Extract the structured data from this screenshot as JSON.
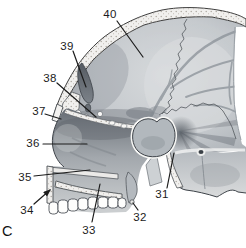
{
  "figure": {
    "panel": "C",
    "callouts": {
      "c40": "40",
      "c39": "39",
      "c38": "38",
      "c37": "37",
      "c36": "36",
      "c35": "35",
      "c34": "34",
      "c33": "33",
      "c32": "32",
      "c31": "31"
    },
    "colors": {
      "background": "#ffffff",
      "outline": "#3c4147",
      "bone_light": "#f1f0ee",
      "cavity_gray": "#c7cbcf",
      "deep_shadow": "#4a5158",
      "label_text": "#1b1b1b"
    }
  }
}
